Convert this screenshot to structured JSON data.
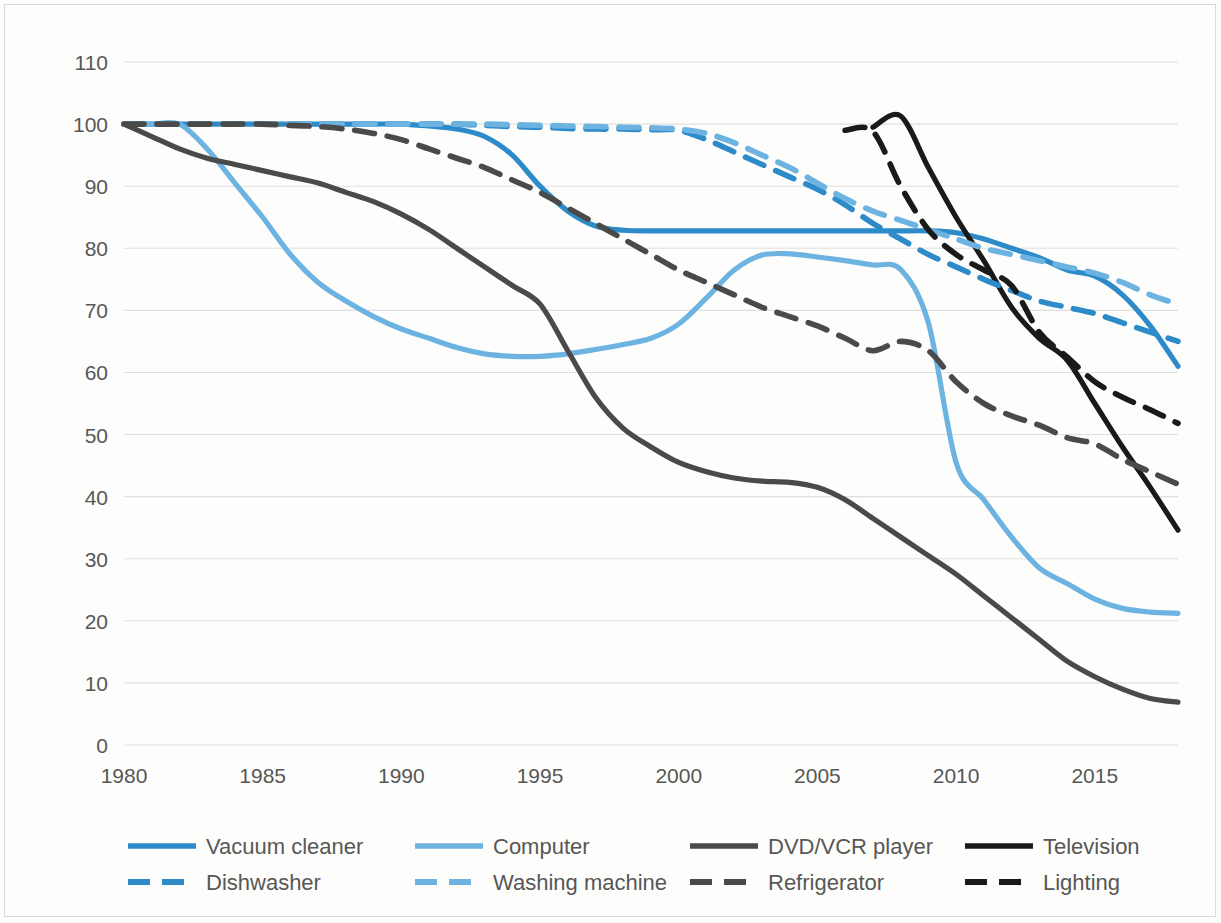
{
  "axes": {
    "y_ticks": [
      "110",
      "100",
      "90",
      "80",
      "70",
      "60",
      "50",
      "40",
      "30",
      "20",
      "10",
      "0"
    ],
    "x_ticks": [
      "1980",
      "1985",
      "1990",
      "1995",
      "2000",
      "2005",
      "2010",
      "2015"
    ]
  },
  "legend": {
    "items": [
      {
        "label": "Vacuum cleaner",
        "color": "#2E8BC9",
        "dash": false
      },
      {
        "label": "Computer",
        "color": "#6DB3E2",
        "dash": false
      },
      {
        "label": "DVD/VCR player",
        "color": "#4A4A4A",
        "dash": false
      },
      {
        "label": "Television",
        "color": "#1A1A1A",
        "dash": false
      },
      {
        "label": "Dishwasher",
        "color": "#2E8BC9",
        "dash": true
      },
      {
        "label": "Washing machine",
        "color": "#6DB3E2",
        "dash": true
      },
      {
        "label": "Refrigerator",
        "color": "#4A4A4A",
        "dash": true
      },
      {
        "label": "Lighting",
        "color": "#1A1A1A",
        "dash": true
      }
    ]
  },
  "chart_data": {
    "type": "line",
    "title": "",
    "xlabel": "",
    "ylabel": "",
    "xlim": [
      1980,
      2018
    ],
    "ylim": [
      0,
      110
    ],
    "ytick_step": 10,
    "xtick_step": 5,
    "grid": true,
    "legend_position": "bottom",
    "x": [
      1980,
      1981,
      1982,
      1983,
      1984,
      1985,
      1986,
      1987,
      1988,
      1989,
      1990,
      1991,
      1992,
      1993,
      1994,
      1995,
      1996,
      1997,
      1998,
      1999,
      2000,
      2001,
      2002,
      2003,
      2004,
      2005,
      2006,
      2007,
      2008,
      2009,
      2010,
      2011,
      2012,
      2013,
      2014,
      2015,
      2016,
      2017,
      2018
    ],
    "series": [
      {
        "name": "Vacuum cleaner",
        "color": "#2E8BC9",
        "style": "solid",
        "values": [
          100,
          100,
          100,
          100,
          100,
          100,
          100,
          100,
          100,
          100,
          100,
          99.7,
          99.2,
          98,
          95,
          90,
          86,
          83.6,
          82.9,
          82.8,
          82.8,
          82.8,
          82.8,
          82.8,
          82.8,
          82.8,
          82.8,
          82.8,
          82.8,
          82.8,
          82.5,
          81.5,
          80,
          78.5,
          76.5,
          75.5,
          72.5,
          67.5,
          61
        ]
      },
      {
        "name": "Computer",
        "color": "#6DB3E2",
        "style": "solid",
        "values": [
          100,
          100,
          100,
          96,
          90.5,
          85,
          79,
          74.5,
          71.5,
          69,
          67,
          65.5,
          64,
          63,
          62.6,
          62.6,
          63,
          63.7,
          64.5,
          65.5,
          67.8,
          72,
          76.5,
          78.9,
          79.1,
          78.6,
          78,
          77.3,
          76.6,
          68,
          45.5,
          39.5,
          33.5,
          28.5,
          26,
          23.5,
          22,
          21.4,
          21.2
        ]
      },
      {
        "name": "DVD/VCR player",
        "color": "#4A4A4A",
        "style": "solid",
        "values": [
          100,
          98,
          96,
          94.5,
          93.5,
          92.5,
          91.5,
          90.5,
          89,
          87.5,
          85.5,
          83,
          80,
          77,
          74,
          71,
          63.5,
          56,
          51,
          48,
          45.5,
          44,
          43,
          42.5,
          42.3,
          41.5,
          39.5,
          36.5,
          33.5,
          30.5,
          27.5,
          24,
          20.5,
          17,
          13.5,
          11,
          9,
          7.5,
          6.9
        ]
      },
      {
        "name": "Television",
        "color": "#1A1A1A",
        "style": "solid",
        "values": [
          null,
          null,
          null,
          null,
          null,
          null,
          null,
          null,
          null,
          null,
          null,
          null,
          null,
          null,
          null,
          null,
          null,
          null,
          null,
          null,
          null,
          null,
          null,
          null,
          null,
          null,
          null,
          99.5,
          101.3,
          93,
          85,
          78,
          70.5,
          65.5,
          62,
          55,
          48,
          41.5,
          34.6
        ]
      },
      {
        "name": "Dishwasher",
        "color": "#2E8BC9",
        "style": "dashed",
        "values": [
          100,
          100,
          100,
          100,
          100,
          100,
          100,
          100,
          100,
          100,
          100,
          100,
          100,
          99.8,
          99.6,
          99.5,
          99.3,
          99.2,
          99.2,
          99.1,
          99,
          97.5,
          95.5,
          93.5,
          91.5,
          89.5,
          87,
          84,
          81.5,
          79,
          77,
          75,
          73.2,
          71.5,
          70.5,
          69.5,
          68,
          66.5,
          65
        ]
      },
      {
        "name": "Washing machine",
        "color": "#6DB3E2",
        "style": "dashed",
        "values": [
          100,
          100,
          100,
          100,
          100,
          100,
          100,
          100,
          100,
          100,
          100,
          100,
          100,
          100,
          99.9,
          99.8,
          99.7,
          99.6,
          99.5,
          99.4,
          99.2,
          98.5,
          97,
          95,
          93,
          90.5,
          88,
          86,
          84.5,
          83,
          81.5,
          80,
          79,
          78,
          77,
          76,
          74.5,
          72.5,
          71
        ]
      },
      {
        "name": "Refrigerator",
        "color": "#4A4A4A",
        "style": "dashed",
        "values": [
          100,
          100,
          100,
          100,
          100,
          100,
          99.8,
          99.6,
          99.2,
          98.5,
          97.5,
          96,
          94.5,
          93,
          91,
          89,
          86.5,
          84,
          81.5,
          79,
          76.5,
          74.5,
          72.5,
          70.5,
          69,
          67.5,
          65.5,
          63.5,
          65,
          63.5,
          58.5,
          55,
          53,
          51.5,
          49.5,
          48.5,
          46,
          44,
          42
        ]
      },
      {
        "name": "Lighting",
        "color": "#1A1A1A",
        "style": "dashed",
        "values": [
          null,
          null,
          null,
          null,
          null,
          null,
          null,
          null,
          null,
          null,
          null,
          null,
          null,
          null,
          null,
          null,
          null,
          null,
          null,
          null,
          null,
          null,
          null,
          null,
          null,
          null,
          99,
          98.8,
          90,
          83,
          79,
          76.5,
          74,
          66.5,
          62.5,
          58.5,
          56,
          54,
          51.8
        ]
      }
    ]
  }
}
